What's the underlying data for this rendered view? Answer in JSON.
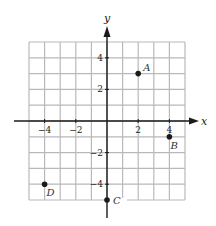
{
  "chart_data": {
    "type": "scatter",
    "title": "",
    "xlabel": "x",
    "ylabel": "y",
    "xlim": [
      -5,
      5
    ],
    "ylim": [
      -5,
      5
    ],
    "grid": true,
    "grid_step": 1,
    "x_ticks": [
      -4,
      -2,
      2,
      4
    ],
    "x_tick_labels": [
      "−4",
      "−2",
      "2",
      "4"
    ],
    "y_ticks": [
      4,
      2,
      -2,
      -4
    ],
    "y_tick_labels": [
      "4",
      "2",
      "−2",
      "−4"
    ],
    "points": [
      {
        "label": "A",
        "x": 2,
        "y": 3
      },
      {
        "label": "B",
        "x": 4,
        "y": -1
      },
      {
        "label": "C",
        "x": 0,
        "y": -5
      },
      {
        "label": "D",
        "x": -4,
        "y": -4
      }
    ],
    "colors": {
      "grid": "#b9b9b9",
      "axis": "#1a1a1a",
      "point": "#1a1a1a"
    }
  }
}
